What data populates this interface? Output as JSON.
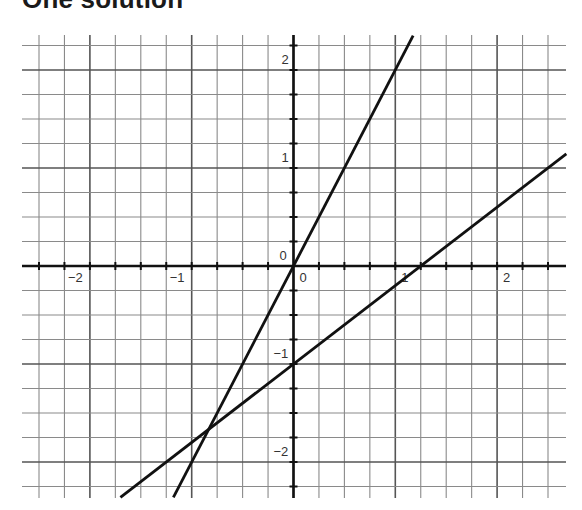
{
  "title": "One solution",
  "chart_data": {
    "type": "line",
    "title": "One solution",
    "xlabel": "",
    "ylabel": "",
    "xlim": [
      -2.65,
      2.65
    ],
    "ylim": [
      -2.36,
      2.35
    ],
    "grid": true,
    "grid_step": 0.25,
    "x_ticks": [
      {
        "value": -2,
        "label": "−2"
      },
      {
        "value": -1,
        "label": "−1"
      },
      {
        "value": 0,
        "label": "0"
      },
      {
        "value": 1,
        "label": "1"
      },
      {
        "value": 2,
        "label": "2"
      }
    ],
    "y_ticks": [
      {
        "value": 2,
        "label": "2"
      },
      {
        "value": 1,
        "label": "1"
      },
      {
        "value": 0,
        "label": "0"
      },
      {
        "value": -1,
        "label": "−1"
      },
      {
        "value": -2,
        "label": "−2"
      }
    ],
    "series": [
      {
        "name": "line-1",
        "equation": "y = 2x",
        "slope": 2,
        "intercept": 0,
        "color": "#111111"
      },
      {
        "name": "line-2",
        "equation": "y = 0.8x - 1",
        "slope": 0.8,
        "intercept": -1,
        "color": "#111111"
      }
    ],
    "intersection": {
      "x": -0.83,
      "y": -1.67
    },
    "annotations": []
  },
  "colors": {
    "minor_grid": "#8a8a8a",
    "major_grid": "#555555",
    "axis": "#111111",
    "line": "#111111"
  }
}
